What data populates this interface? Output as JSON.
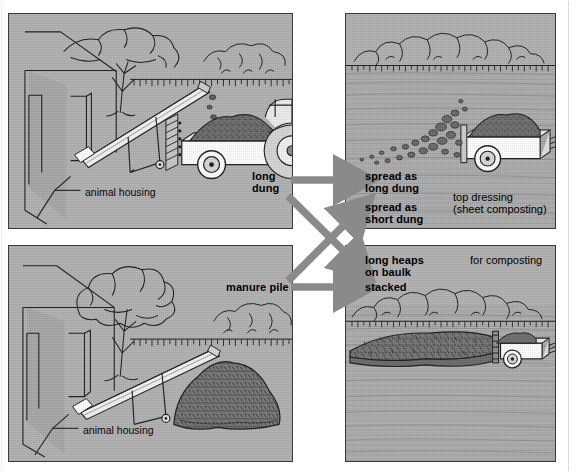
{
  "figure": {
    "type": "process-flow-illustration",
    "background_color": "#b2b2b2",
    "ink_color": "#1a1a1a",
    "arrow_color": "#8a8a8a",
    "dung_color": "#6f6f6f"
  },
  "panels": {
    "top_left": {
      "name": "loading-long-dung",
      "caption": "animal housing",
      "scene_items": [
        "farm building",
        "tree",
        "hedge",
        "conveyor / elevator",
        "trailer with dung heap",
        "tractor"
      ]
    },
    "top_right": {
      "name": "spreading-on-field",
      "note_line1": "top dressing",
      "note_line2": "(sheet composting)",
      "scene_items": [
        "hedge row",
        "open field",
        "manure spreader throwing dung",
        "clods of dung"
      ]
    },
    "bottom_left": {
      "name": "manure-pile-at-housing",
      "caption": "animal housing",
      "scene_items": [
        "farm building",
        "tree",
        "hedge",
        "conveyor / elevator",
        "manure pile"
      ]
    },
    "bottom_right": {
      "name": "long-heap-for-composting",
      "note_line1": "for composting",
      "scene_items": [
        "hedge row",
        "long composting heap on baulk",
        "trailer"
      ]
    }
  },
  "flow": {
    "sources": [
      {
        "id": "long-dung",
        "label_line1": "long",
        "label_line2": "dung"
      },
      {
        "id": "manure-pile",
        "label_line1": "manure pile",
        "label_line2": ""
      }
    ],
    "destinations": [
      {
        "id": "spread-long-dung",
        "label_line1": "spread as",
        "label_line2": "long dung"
      },
      {
        "id": "spread-short-dung",
        "label_line1": "spread as",
        "label_line2": "short dung"
      },
      {
        "id": "long-heaps",
        "label_line1": "long heaps",
        "label_line2": "on baulk"
      },
      {
        "id": "stacked",
        "label_line1": "stacked",
        "label_line2": ""
      }
    ],
    "arrows": [
      {
        "from": "long-dung",
        "to": "spread-long-dung",
        "direction": "horizontal-right"
      },
      {
        "from": "long-dung",
        "to": "long-heaps",
        "direction": "diagonal-down-right"
      },
      {
        "from": "manure-pile",
        "to": "spread-short-dung",
        "direction": "diagonal-up-right"
      },
      {
        "from": "manure-pile",
        "to": "stacked",
        "direction": "horizontal-right"
      }
    ]
  },
  "notes": {
    "top_dressing_line1": "top dressing",
    "top_dressing_line2": "(sheet composting)",
    "for_composting": "for composting"
  },
  "captions": {
    "animal_housing_top": "animal housing",
    "animal_housing_bottom": "animal housing"
  }
}
